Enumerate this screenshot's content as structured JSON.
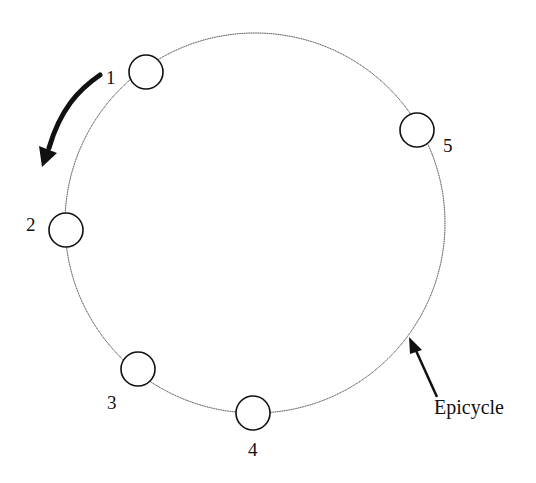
{
  "diagram": {
    "orbit_label": "Epicycle",
    "positions": [
      {
        "id": "1",
        "label": "1"
      },
      {
        "id": "2",
        "label": "2"
      },
      {
        "id": "3",
        "label": "3"
      },
      {
        "id": "4",
        "label": "4"
      },
      {
        "id": "5",
        "label": "5"
      }
    ],
    "motion_direction": "counterclockwise",
    "colors": {
      "stroke": "#111111",
      "orbit": "#333333",
      "fill": "#ffffff"
    }
  }
}
